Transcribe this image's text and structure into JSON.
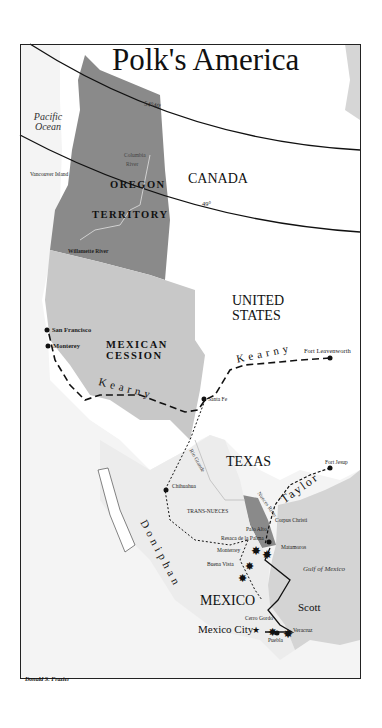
{
  "map": {
    "title": "Polk's America",
    "credit": "Donald S. Frazier",
    "colors": {
      "oregon_territory": "#8a8a8a",
      "mexican_cession": "#c8c8c8",
      "other_land": "#f2f2f2",
      "water": "#d6d6d6",
      "white_land": "#ffffff",
      "lines": "#111111"
    },
    "latitude_lines": [
      "54°40'",
      "49°"
    ],
    "water_labels": {
      "pacific": "Pacific Ocean",
      "gulf": "Gulf of Mexico"
    },
    "regions": {
      "canada": "CANADA",
      "oregon_1": "OREGON",
      "oregon_2": "TERRITORY",
      "cession_1": "MEXICAN",
      "cession_2": "CESSION",
      "us_1": "UNITED",
      "us_2": "STATES",
      "texas": "TEXAS",
      "mexico": "MEXICO",
      "trans_nueces": "TRANS-NUECES"
    },
    "rivers": {
      "columbia_1": "Columbia",
      "columbia_2": "River",
      "willamette": "Willamette River",
      "rio_grande": "Rio Grande",
      "nueces": "Nueces River"
    },
    "places": {
      "vancouver_island": "Vancouver Island",
      "san_francisco": "San Francisco",
      "monterey_ca": "Monterey",
      "santa_fe": "Santa Fe",
      "fort_leavenworth": "Fort Leavenworth",
      "fort_jesup": "Fort Jesup",
      "chihuahua": "Chihuahua",
      "corpus_christi": "Corpus Christi",
      "palo_alto": "Palo Alto",
      "resaca": "Resaca de la Palma",
      "matamoros": "Matamoros",
      "monterrey": "Monterrey",
      "buena_vista": "Buena Vista",
      "mexico_city": "Mexico City",
      "cerro_gordo": "Cerro Gordo",
      "puebla": "Puebla",
      "veracruz": "Veracruz"
    },
    "routes": {
      "kearny_east": "Kearny",
      "kearny_west": "Kearny",
      "doniphan": "Doniphan",
      "taylor": "Taylor",
      "scott": "Scott"
    }
  }
}
